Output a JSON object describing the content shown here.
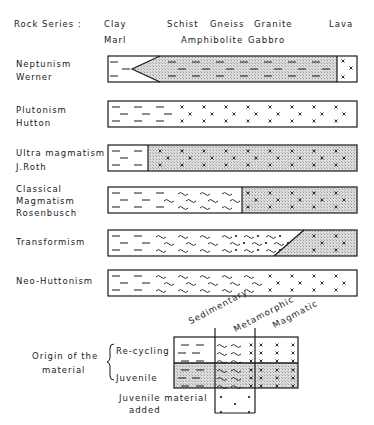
{
  "header": {
    "label": "Rock Series :",
    "rocks_top": [
      "Clay",
      "Schist",
      "Gneiss",
      "Granite",
      "Lava"
    ],
    "rocks_bottom": [
      "Marl",
      "Amphibolite",
      "Gabbro"
    ]
  },
  "theories": [
    {
      "name": "Neptunism",
      "author": "Werner"
    },
    {
      "name": "Plutonism",
      "author": "Hutton"
    },
    {
      "name": "Ultra magmatism",
      "author": "J.Roth"
    },
    {
      "name": "Classical",
      "name2": "Magmatism",
      "author": "Rosenbusch"
    },
    {
      "name": "Transformism"
    },
    {
      "name": "Neo-Huttonism"
    }
  ],
  "legend": {
    "title_line1": "Origin of the",
    "title_line2": "material",
    "rows": [
      "Re-cycling",
      "Juvenile"
    ],
    "added_line1": "Juvenile material",
    "added_line2": "added",
    "columns": [
      "Sedimentary",
      "Metamorphic",
      "Magmatic"
    ]
  },
  "colors": {
    "line": "#1a1a1a",
    "shade": "#d4d4d4"
  }
}
